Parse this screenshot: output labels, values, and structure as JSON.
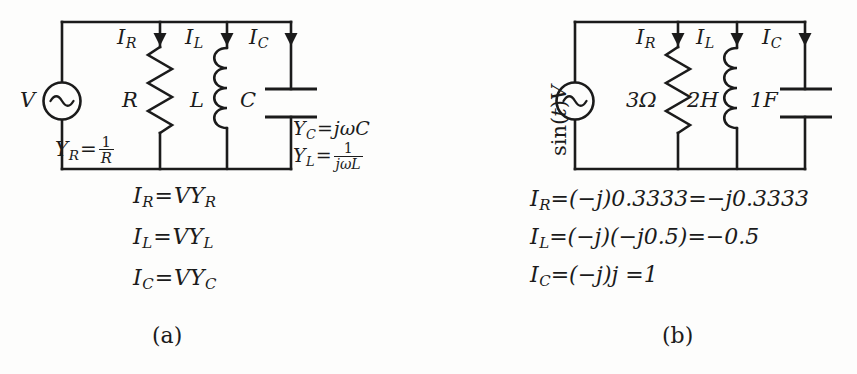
{
  "figure": {
    "background": "#fdfdfc",
    "ink": "#1b1b1b"
  },
  "panels": [
    {
      "id": "a",
      "caption": "(a)",
      "source": {
        "label_v": "V",
        "symbol": "ac-source-sine"
      },
      "branch_currents": [
        {
          "name": "I_R",
          "label_I": "I",
          "label_sub": "R"
        },
        {
          "name": "I_L",
          "label_I": "I",
          "label_sub": "L"
        },
        {
          "name": "I_C",
          "label_I": "I",
          "label_sub": "C"
        }
      ],
      "components": [
        {
          "type": "resistor",
          "label": "R"
        },
        {
          "type": "inductor",
          "label": "L"
        },
        {
          "type": "capacitor",
          "label": "C"
        }
      ],
      "admittance_notes": [
        {
          "lhs_I": "Y",
          "lhs_sub": "R",
          "rhs_kind": "fraction",
          "num": "1",
          "den": "R"
        },
        {
          "lhs_I": "Y",
          "lhs_sub": "C",
          "rhs_kind": "plain",
          "rhs": "jωC"
        },
        {
          "lhs_I": "Y",
          "lhs_sub": "L",
          "rhs_kind": "fraction",
          "num": "1",
          "den": "jωL"
        }
      ],
      "equations": [
        {
          "lhs_I": "I",
          "lhs_sub": "R",
          "rhs_V": "V",
          "rhs_Y": "Y",
          "rhs_sub": "R"
        },
        {
          "lhs_I": "I",
          "lhs_sub": "L",
          "rhs_V": "V",
          "rhs_Y": "Y",
          "rhs_sub": "L"
        },
        {
          "lhs_I": "I",
          "lhs_sub": "C",
          "rhs_V": "V",
          "rhs_Y": "Y",
          "rhs_sub": "C"
        }
      ]
    },
    {
      "id": "b",
      "caption": "(b)",
      "source": {
        "label_prefix": "sin(",
        "label_var": "t",
        "label_suffix": ")",
        "label_v": "V",
        "symbol": "ac-source-sine"
      },
      "branch_currents": [
        {
          "name": "I_R",
          "label_I": "I",
          "label_sub": "R"
        },
        {
          "name": "I_L",
          "label_I": "I",
          "label_sub": "L"
        },
        {
          "name": "I_C",
          "label_I": "I",
          "label_sub": "C"
        }
      ],
      "components": [
        {
          "type": "resistor",
          "label": "3Ω"
        },
        {
          "type": "inductor",
          "label": "2H"
        },
        {
          "type": "capacitor",
          "label": "1F"
        }
      ],
      "equations": [
        {
          "lhs_I": "I",
          "lhs_sub": "R",
          "rhs": "=(−j)0.3333=−j0.3333"
        },
        {
          "lhs_I": "I",
          "lhs_sub": "L",
          "rhs": "=(−j)(−j0.5)=−0.5"
        },
        {
          "lhs_I": "I",
          "lhs_sub": "C",
          "rhs": "=(−j)j =1"
        }
      ]
    }
  ]
}
